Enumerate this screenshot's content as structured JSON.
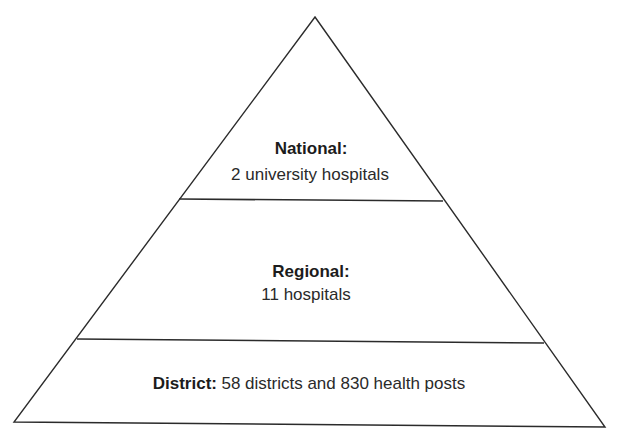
{
  "diagram": {
    "type": "pyramid",
    "shape": {
      "apex": [
        315,
        17
      ],
      "base_left": [
        14,
        422
      ],
      "base_right": [
        605,
        427
      ]
    },
    "colors": {
      "stroke": "#2b2b2b",
      "fill": "#ffffff",
      "text": "#222222"
    },
    "tiers": [
      {
        "id": "national",
        "title": "National:",
        "description": "2 university hospitals",
        "layout": "stacked",
        "divider_below": {
          "x1": 179,
          "y1": 199,
          "x2": 443,
          "y2": 201
        }
      },
      {
        "id": "regional",
        "title": "Regional:",
        "description": "11 hospitals",
        "layout": "stacked",
        "divider_below": {
          "x1": 77,
          "y1": 339,
          "x2": 544,
          "y2": 343
        }
      },
      {
        "id": "district",
        "title": "District:",
        "description": "58 districts and 830 health posts",
        "layout": "inline"
      }
    ]
  }
}
